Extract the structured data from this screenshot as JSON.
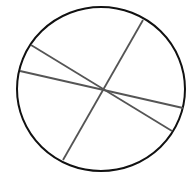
{
  "diagram": {
    "shape": "circle",
    "line_count": 3,
    "colors": {
      "circle_stroke": "#111111",
      "line_stroke": "#555555",
      "background": "#ffffff"
    }
  }
}
